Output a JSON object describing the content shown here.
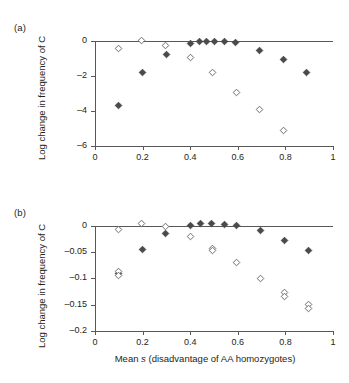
{
  "figure": {
    "panels": [
      {
        "id": "a",
        "label": "(a)",
        "ylabel": "Log change in frequency of C",
        "xlabel": "",
        "ylim": [
          -6,
          0.45
        ],
        "xlim": [
          0,
          1
        ],
        "yticks": [
          0,
          -2,
          -4,
          -6
        ],
        "yticklabels": [
          "0",
          "–2",
          "–4",
          "–6"
        ],
        "xticks": [
          0,
          0.2,
          0.4,
          0.6,
          0.8,
          1
        ],
        "xticklabels": [
          "0",
          "0.2",
          "0.4",
          "0.6",
          "0.8",
          "1"
        ]
      },
      {
        "id": "b",
        "label": "(b)",
        "ylabel": "Log change in frequency of C",
        "xlabel": "Mean s (disadvantage of AA homozygotes)",
        "ylim": [
          -0.2,
          0.015
        ],
        "xlim": [
          0,
          1
        ],
        "yticks": [
          0,
          -0.05,
          -0.1,
          -0.15,
          -0.2
        ],
        "yticklabels": [
          "0",
          "–0.05",
          "–0.1",
          "–0.15",
          "–0.2"
        ],
        "xticks": [
          0,
          0.2,
          0.4,
          0.6,
          0.8,
          1
        ],
        "xticklabels": [
          "0",
          "0.2",
          "0.4",
          "0.6",
          "0.8",
          "1"
        ]
      }
    ],
    "colors": {
      "axis": "#58585b",
      "marker_filled": "#4a4a4d",
      "marker_open_edge": "#6d6d70",
      "text": "#231f20",
      "background": "#ffffff"
    }
  },
  "chart_data": [
    {
      "type": "scatter",
      "panel": "a",
      "title": "",
      "xlabel": "Mean s (disadvantage of AA homozygotes)",
      "ylabel": "Log change in frequency of C",
      "xlim": [
        0,
        1
      ],
      "ylim": [
        -6,
        0.45
      ],
      "grid": false,
      "legend": null,
      "annotations": [
        "(a)"
      ],
      "series": [
        {
          "name": "filled-diamond",
          "marker": "filled-diamond",
          "points": [
            {
              "x": 0.1,
              "y": -3.66
            },
            {
              "x": 0.2,
              "y": -1.83
            },
            {
              "x": 0.3,
              "y": -0.78
            },
            {
              "x": 0.4,
              "y": -0.17
            },
            {
              "x": 0.44,
              "y": -0.05
            },
            {
              "x": 0.47,
              "y": -0.02
            },
            {
              "x": 0.5,
              "y": -0.02
            },
            {
              "x": 0.545,
              "y": -0.04
            },
            {
              "x": 0.59,
              "y": -0.12
            },
            {
              "x": 0.69,
              "y": -0.57
            },
            {
              "x": 0.79,
              "y": -1.08
            },
            {
              "x": 0.89,
              "y": -1.8
            }
          ]
        },
        {
          "name": "open-diamond",
          "marker": "open-diamond",
          "points": [
            {
              "x": 0.1,
              "y": -0.46
            },
            {
              "x": 0.195,
              "y": 0.02
            },
            {
              "x": 0.295,
              "y": -0.25
            },
            {
              "x": 0.4,
              "y": -0.97
            },
            {
              "x": 0.495,
              "y": -1.81
            },
            {
              "x": 0.595,
              "y": -2.93
            },
            {
              "x": 0.69,
              "y": -3.94
            },
            {
              "x": 0.79,
              "y": -5.14
            }
          ]
        }
      ]
    },
    {
      "type": "scatter",
      "panel": "b",
      "title": "",
      "xlabel": "Mean s (disadvantage of AA homozygotes)",
      "ylabel": "Log change in frequency of C",
      "xlim": [
        0,
        1
      ],
      "ylim": [
        -0.2,
        0.015
      ],
      "grid": false,
      "legend": null,
      "annotations": [
        "(b)"
      ],
      "series": [
        {
          "name": "filled-diamond",
          "marker": "filled-diamond",
          "points": [
            {
              "x": 0.1,
              "y": -0.091
            },
            {
              "x": 0.2,
              "y": -0.0445
            },
            {
              "x": 0.295,
              "y": -0.0145
            },
            {
              "x": 0.4,
              "y": 0.001
            },
            {
              "x": 0.445,
              "y": 0.004
            },
            {
              "x": 0.49,
              "y": 0.005
            },
            {
              "x": 0.545,
              "y": 0.003
            },
            {
              "x": 0.595,
              "y": 0.0
            },
            {
              "x": 0.695,
              "y": -0.0085
            },
            {
              "x": 0.795,
              "y": -0.027
            },
            {
              "x": 0.895,
              "y": -0.046
            }
          ]
        },
        {
          "name": "open-diamond",
          "marker": "open-diamond",
          "points": [
            {
              "x": 0.1,
              "y": -0.0875
            },
            {
              "x": 0.1,
              "y": -0.094
            },
            {
              "x": 0.1,
              "y": -0.006
            },
            {
              "x": 0.195,
              "y": 0.0045
            },
            {
              "x": 0.295,
              "y": -0.002
            },
            {
              "x": 0.4,
              "y": -0.0205
            },
            {
              "x": 0.495,
              "y": -0.0435
            },
            {
              "x": 0.495,
              "y": -0.047
            },
            {
              "x": 0.595,
              "y": -0.0705
            },
            {
              "x": 0.695,
              "y": -0.1
            },
            {
              "x": 0.795,
              "y": -0.1265
            },
            {
              "x": 0.795,
              "y": -0.1335
            },
            {
              "x": 0.895,
              "y": -0.1505
            },
            {
              "x": 0.895,
              "y": -0.158
            }
          ]
        }
      ]
    }
  ]
}
